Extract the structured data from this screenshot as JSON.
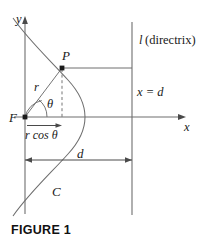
{
  "figure": {
    "caption": "FIGURE 1",
    "labels": {
      "y_axis": "y",
      "x_axis": "x",
      "focus": "F",
      "point": "P",
      "radius": "r",
      "angle": "θ",
      "projection": "r cos θ",
      "distance": "d",
      "curve": "C",
      "directrix_name": "l",
      "directrix_note": "(directrix)",
      "directrix_equation": "x = d"
    },
    "colors": {
      "line": "#6e6e6e",
      "text": "#1a1a1a",
      "caption": "#111111",
      "background": "#ffffff"
    },
    "geometry": {
      "type": "conic-section-polar-diagram",
      "focus_point": [
        25,
        117
      ],
      "point_P": [
        62,
        68
      ],
      "vertex": [
        85,
        117
      ],
      "directrix_x": 132,
      "y_axis_x": 25,
      "x_axis_y": 117,
      "dimension_d_y": 160,
      "r_cos_theta_y": 126
    }
  }
}
